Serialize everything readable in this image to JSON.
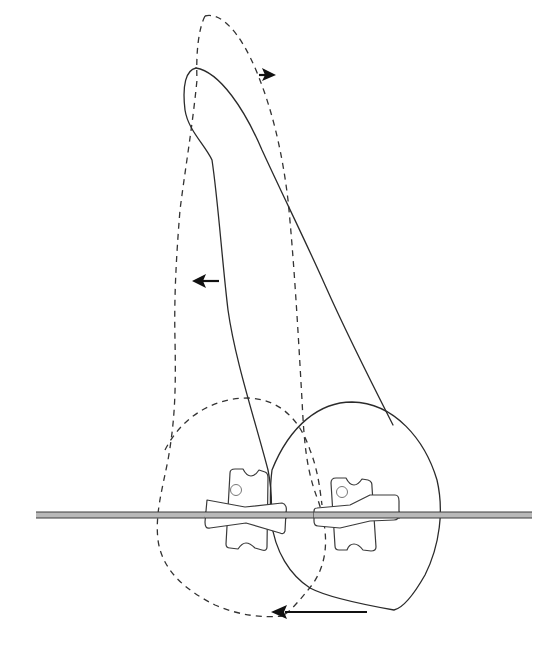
{
  "figure": {
    "colors": {
      "line": "#2b2b2b",
      "dashed": "#333333",
      "wire_fill": "#b8b8b8",
      "arrow": "#111111",
      "background": "#ffffff"
    },
    "elements": {
      "tooth_initial": {
        "style": "dashed",
        "label": ""
      },
      "tooth_final": {
        "style": "solid",
        "label": ""
      },
      "archwire": {
        "style": "double-line",
        "label": ""
      },
      "brackets": [
        {
          "label": "",
          "position": "left"
        },
        {
          "label": "",
          "position": "right"
        }
      ],
      "arrows": [
        {
          "direction": "right",
          "location": "root-apex"
        },
        {
          "direction": "left",
          "location": "mid-root"
        },
        {
          "direction": "left",
          "location": "crown-incisal"
        }
      ]
    }
  }
}
